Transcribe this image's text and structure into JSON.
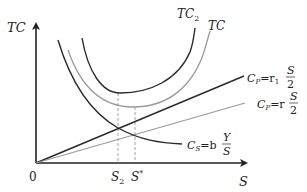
{
  "diagram": {
    "title": "",
    "axes": {
      "y_label": "TC",
      "x_label": "S",
      "origin_label": "0"
    },
    "curves": {
      "tc2_label": "TC",
      "tc2_sub": "2",
      "tc_label": "TC",
      "cp1_label_left": "C",
      "cp1_label_sub": "P",
      "cp1_label_eq": "=r",
      "cp1_label_eq_sub": "1",
      "cp1_frac_num": "S",
      "cp1_frac_den": "2",
      "cp_label_left": "C",
      "cp_label_sub": "P",
      "cp_label_eq": "=r",
      "cp_frac_num": "S",
      "cp_frac_den": "2",
      "cs_label_left": "C",
      "cs_label_sub": "S",
      "cs_label_eq": "=b",
      "cs_frac_num": "Y",
      "cs_frac_den": "S"
    },
    "ticks": {
      "s2_label": "S",
      "s2_sub": "2",
      "sstar_label": "S",
      "sstar_sup": "*"
    },
    "colors": {
      "dark": "#2a2a2a",
      "gray": "#9a9a9a",
      "dash": "#8a8a8a"
    }
  }
}
